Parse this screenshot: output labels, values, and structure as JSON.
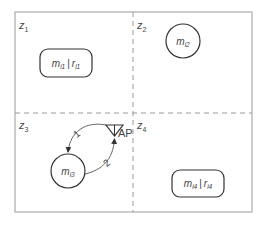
{
  "diagram": {
    "zones": [
      {
        "id": "z1",
        "base": "z",
        "sub": "1"
      },
      {
        "id": "z2",
        "base": "z",
        "sub": "2"
      },
      {
        "id": "z3",
        "base": "z",
        "sub": "3"
      },
      {
        "id": "z4",
        "base": "z",
        "sub": "4"
      }
    ],
    "nodes": {
      "box1": {
        "m_base": "m",
        "m_sub": "i1",
        "sep": "|",
        "r_base": "r",
        "r_sub": "i1"
      },
      "circle2": {
        "m_base": "m",
        "m_sub": "i2"
      },
      "circle3": {
        "m_base": "m",
        "m_sub": "i3"
      },
      "box4": {
        "m_base": "m",
        "m_sub": "i4",
        "sep": "|",
        "r_base": "r",
        "r_sub": "i4"
      }
    },
    "access_point": {
      "label": "AP"
    },
    "edges": [
      {
        "label": "1",
        "from": "AP",
        "to": "m_i3"
      },
      {
        "label": "2",
        "from": "m_i3",
        "to": "AP"
      }
    ],
    "colors": {
      "border": "#9a9a9a",
      "divider": "#9a9a9a",
      "stroke": "#333333",
      "text": "#444444"
    }
  }
}
